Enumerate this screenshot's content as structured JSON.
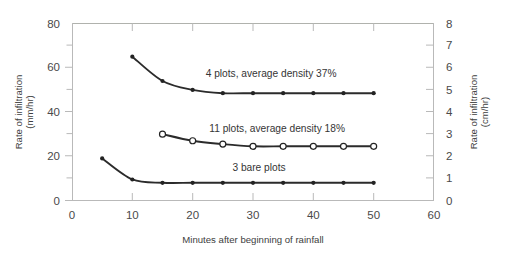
{
  "chart_data": {
    "type": "line",
    "title": "",
    "xlabel": "Minutes after beginning of rainfall",
    "ylabel": "Rate of infiltration\n(mm/hr)",
    "ylabel_line1": "Rate of infiltration",
    "ylabel_line2": "(mm/hr)",
    "y2label_line1": "Rate of infiltration",
    "y2label_line2": "(cm/hr)",
    "xlim": [
      0,
      60
    ],
    "ylim": [
      0,
      80
    ],
    "y2lim": [
      0,
      8
    ],
    "grid": false,
    "legend_position": "inline-annotations",
    "xticks": [
      0,
      10,
      20,
      30,
      40,
      50,
      60
    ],
    "xtick_labels": [
      "0",
      "10",
      "20",
      "30",
      "40",
      "50",
      "60"
    ],
    "yticks": [
      0,
      20,
      40,
      60,
      80
    ],
    "ytick_labels": [
      "0",
      "20",
      "40",
      "60",
      "80"
    ],
    "yticks_minor": [
      10,
      30,
      50,
      70
    ],
    "y2ticks": [
      0,
      1,
      2,
      3,
      4,
      5,
      6,
      7,
      8
    ],
    "y2tick_labels": [
      "0",
      "1",
      "2",
      "3",
      "4",
      "5",
      "6",
      "7",
      "8"
    ],
    "series": [
      {
        "name": "4 plots, average density 37%",
        "marker": "filled-circle",
        "x": [
          10,
          15,
          20,
          25,
          30,
          35,
          40,
          45,
          50
        ],
        "values": [
          65,
          54,
          50,
          48.5,
          48.5,
          48.5,
          48.5,
          48.5,
          48.5
        ]
      },
      {
        "name": "11 plots, average density 18%",
        "marker": "open-circle",
        "x": [
          15,
          20,
          25,
          30,
          35,
          40,
          45,
          50
        ],
        "values": [
          30,
          27,
          25.5,
          24.5,
          24.5,
          24.5,
          24.5,
          24.5
        ]
      },
      {
        "name": "3 bare plots",
        "marker": "filled-circle",
        "x": [
          5,
          10,
          15,
          20,
          25,
          30,
          35,
          40,
          45,
          50
        ],
        "values": [
          19,
          9.5,
          8,
          8,
          8,
          8,
          8,
          8,
          8,
          8
        ]
      }
    ],
    "annotations": [
      {
        "text": "4 plots, average density 37%",
        "x": 33,
        "y": 56
      },
      {
        "text": "11 plots, average density 18%",
        "x": 34,
        "y": 31
      },
      {
        "text": "3 bare plots",
        "x": 31,
        "y": 13.5
      }
    ],
    "colors": {
      "line": "#2b2b2b",
      "frame": "#b9b9b9",
      "text": "#404040",
      "background": "#ffffff"
    }
  }
}
